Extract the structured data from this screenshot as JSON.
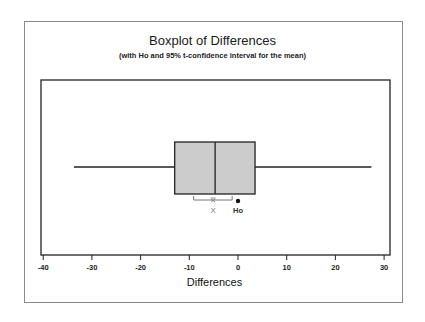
{
  "chart_data": {
    "type": "boxplot",
    "title": "Boxplot of Differences",
    "subtitle": "(with Ho and 95% t-confidence interval for the mean)",
    "xlabel": "Differences",
    "ylabel": "",
    "xlim": [
      -40,
      30
    ],
    "x_ticks": [
      -40,
      -30,
      -20,
      -10,
      0,
      10,
      20,
      30
    ],
    "x_tick_labels": [
      "-40",
      "-30",
      "-20",
      "-10",
      "0",
      "10",
      "20",
      "30"
    ],
    "grid": false,
    "legend": null,
    "series": [
      {
        "name": "Differences",
        "min": -33.7,
        "q1": -13.0,
        "median": -4.7,
        "q3": 3.5,
        "max": 27.4,
        "mean": -5.1,
        "ci_95": [
          -9.1,
          -1.2
        ]
      }
    ],
    "annotations": [
      {
        "label": "X",
        "meaning": "sample mean marker",
        "x": -5.1
      },
      {
        "label": "Ho",
        "meaning": "hypothesized mean (null)",
        "x": 0
      }
    ],
    "colors": {
      "box_fill": "#cccccc",
      "lines": "#222222",
      "ci_bracket": "#777777"
    }
  },
  "labels": {
    "mean_marker": "X",
    "ho_marker": "Ho"
  }
}
